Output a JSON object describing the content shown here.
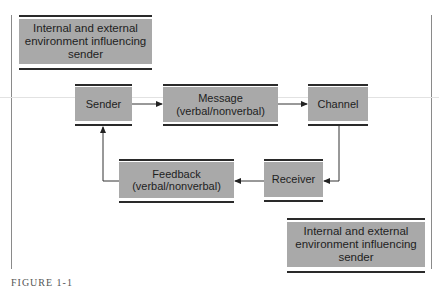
{
  "diagram": {
    "type": "communication-process-flow",
    "nodes": {
      "env_sender": {
        "line1": "Internal and external",
        "line2": "environment influencing",
        "line3": "sender"
      },
      "sender": {
        "label": "Sender"
      },
      "message": {
        "line1": "Message",
        "line2": "(verbal/nonverbal)"
      },
      "channel": {
        "label": "Channel"
      },
      "receiver": {
        "label": "Receiver"
      },
      "feedback": {
        "line1": "Feedback",
        "line2": "(verbal/nonverbal)"
      },
      "env_receiver": {
        "line1": "Internal and external",
        "line2": "environment influencing",
        "line3": "sender"
      }
    },
    "edges": [
      {
        "from": "Sender",
        "to": "Message"
      },
      {
        "from": "Message",
        "to": "Channel"
      },
      {
        "from": "Channel",
        "to": "Receiver"
      },
      {
        "from": "Receiver",
        "to": "Feedback"
      },
      {
        "from": "Feedback",
        "to": "Sender"
      }
    ],
    "colors": {
      "box_fill": "#a9a9a9",
      "rule": "#2a2a2a",
      "line": "#333333"
    }
  },
  "caption": "FIGURE 1-1"
}
